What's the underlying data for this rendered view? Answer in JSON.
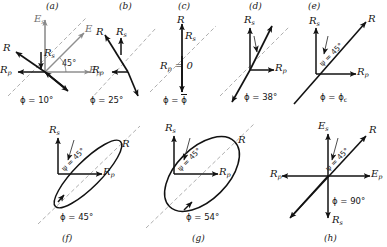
{
  "figure": {
    "reference_line": "45-degree gray dashed reference line",
    "panels": [
      {
        "id": "a",
        "label": "(a)",
        "phi": "ϕ = 10°",
        "angle_note": "45°",
        "vectors": [
          {
            "name": "E_s",
            "label_main": "E",
            "label_sub": "s",
            "color": "#808080",
            "dir": "up"
          },
          {
            "name": "E",
            "label_main": "E",
            "label_sub": "",
            "color": "#808080",
            "dir": "up-right-45"
          },
          {
            "name": "E_p",
            "label_main": "E",
            "label_sub": "p",
            "color": "#808080",
            "dir": "right"
          },
          {
            "name": "R",
            "label_main": "R",
            "label_sub": "",
            "color": "#111111",
            "dir": "up-left"
          },
          {
            "name": "R_s",
            "label_main": "R",
            "label_sub": "s",
            "color": "#111111",
            "dir": "down-short"
          },
          {
            "name": "R_p",
            "label_main": "R",
            "label_sub": "p",
            "color": "#111111",
            "dir": "left"
          }
        ]
      },
      {
        "id": "b",
        "label": "(b)",
        "phi": "ϕ = 25°",
        "vectors": [
          {
            "name": "R",
            "label_main": "R",
            "label_sub": "",
            "color": "#111111",
            "dir": "up-left-steep"
          },
          {
            "name": "R_s",
            "label_main": "R",
            "label_sub": "s",
            "color": "#111111",
            "dir": "up-short"
          },
          {
            "name": "R_p",
            "label_main": "R",
            "label_sub": "p",
            "color": "#111111",
            "dir": "left-short"
          }
        ]
      },
      {
        "id": "c",
        "label": "(c)",
        "phi": "ϕ = ϕ̄",
        "phi_prefix": "ϕ = ",
        "phi_barred": "ϕ",
        "rp_zero": "R",
        "rp_zero_sub": "p",
        "rp_zero_rest": "= 0",
        "vectors": [
          {
            "name": "R",
            "label_main": "R",
            "label_sub": "",
            "color": "#111111",
            "dir": "up"
          },
          {
            "name": "R_s",
            "label_main": "R",
            "label_sub": "s",
            "color": "#111111",
            "dir": "up"
          }
        ]
      },
      {
        "id": "d",
        "label": "(d)",
        "phi": "ϕ = 38°",
        "psi": "ψ",
        "vectors": [
          {
            "name": "R_s",
            "label_main": "R",
            "label_sub": "s",
            "color": "#111111",
            "dir": "up"
          },
          {
            "name": "R_p",
            "label_main": "R",
            "label_sub": "p",
            "color": "#111111",
            "dir": "right"
          },
          {
            "name": "R",
            "label_main": "R",
            "label_sub": "",
            "color": "#111111",
            "dir": "up-right-steep"
          }
        ]
      },
      {
        "id": "e",
        "label": "(e)",
        "phi": "ϕ = ϕ",
        "phi_sub": "c",
        "psi_angle": "ψ = 45°",
        "vectors": [
          {
            "name": "R_s",
            "label_main": "R",
            "label_sub": "s",
            "color": "#111111",
            "dir": "up"
          },
          {
            "name": "R_p",
            "label_main": "R",
            "label_sub": "p",
            "color": "#111111",
            "dir": "right"
          },
          {
            "name": "R",
            "label_main": "R",
            "label_sub": "",
            "color": "#111111",
            "dir": "up-right-45"
          }
        ]
      },
      {
        "id": "f",
        "label": "(f)",
        "phi": "ϕ = 45°",
        "psi_angle": "ψ = 45°",
        "shape": "narrow ellipse tilted 45°",
        "ellipse_rx": 46,
        "ellipse_ry": 13,
        "vectors": [
          {
            "name": "R_s",
            "label_main": "R",
            "label_sub": "s",
            "color": "#111111",
            "dir": "up"
          },
          {
            "name": "R_p",
            "label_main": "R",
            "label_sub": "p",
            "color": "#111111",
            "dir": "right"
          },
          {
            "name": "R",
            "label_main": "R",
            "label_sub": "",
            "color": "#111111",
            "dir": "up-right-45"
          }
        ]
      },
      {
        "id": "g",
        "label": "(g)",
        "phi": "ϕ = 54°",
        "psi_angle": "ψ = 45°",
        "shape": "broad ellipse tilted 45°",
        "ellipse_rx": 46,
        "ellipse_ry": 26,
        "vectors": [
          {
            "name": "R_s",
            "label_main": "R",
            "label_sub": "s",
            "color": "#111111",
            "dir": "up"
          },
          {
            "name": "R_p",
            "label_main": "R",
            "label_sub": "p",
            "color": "#111111",
            "dir": "right"
          },
          {
            "name": "R",
            "label_main": "R",
            "label_sub": "",
            "color": "#111111",
            "dir": "up-right-45"
          }
        ]
      },
      {
        "id": "h",
        "label": "(h)",
        "phi": "ϕ = 90°",
        "psi_angle": "ψ = 45°",
        "vectors": [
          {
            "name": "E_s",
            "label_main": "E",
            "label_sub": "s",
            "color": "#111111",
            "dir": "up"
          },
          {
            "name": "E_p",
            "label_main": "E",
            "label_sub": "p",
            "color": "#111111",
            "dir": "right"
          },
          {
            "name": "R_p",
            "label_main": "R",
            "label_sub": "p",
            "color": "#111111",
            "dir": "left"
          },
          {
            "name": "R_s",
            "label_main": "R",
            "label_sub": "s",
            "color": "#111111",
            "dir": "down"
          },
          {
            "name": "R",
            "label_main": "R",
            "label_sub": "",
            "color": "#111111",
            "dir": "up-right-45"
          }
        ]
      }
    ]
  }
}
